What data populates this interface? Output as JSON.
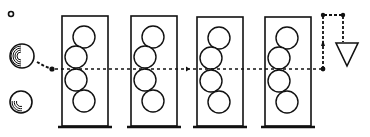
{
  "diagram": {
    "colors": {
      "ink": "#111111",
      "background": "#ffffff"
    },
    "source_items": [
      {
        "id": "small-particle",
        "cx": 11,
        "cy": 14,
        "r": 2.5
      },
      {
        "id": "sphere-top",
        "cx": 22,
        "cy": 56,
        "r": 12,
        "hatch": "left"
      },
      {
        "id": "sphere-bottom",
        "cx": 21,
        "cy": 102,
        "r": 11,
        "hatch": "bottom-left"
      }
    ],
    "columns": [
      {
        "id": "column-1",
        "x": 62,
        "y": 16,
        "w": 46,
        "h": 110
      },
      {
        "id": "column-2",
        "x": 131,
        "y": 16,
        "w": 46,
        "h": 110
      },
      {
        "id": "column-3",
        "x": 197,
        "y": 17,
        "w": 46,
        "h": 109
      },
      {
        "id": "column-4",
        "x": 265,
        "y": 17,
        "w": 46,
        "h": 109
      }
    ],
    "column_spheres": [
      {
        "dx": 22,
        "dy": 21,
        "r": 11
      },
      {
        "dx": 14,
        "dy": 41,
        "r": 11
      },
      {
        "dx": 14,
        "dy": 64,
        "r": 11
      },
      {
        "dx": 22,
        "dy": 85,
        "r": 11
      }
    ],
    "flow_path": {
      "y": 69,
      "start_x": 55,
      "end_x": 323,
      "arrow_markers_x": [
        186
      ],
      "return_path": [
        [
          323,
          69
        ],
        [
          323,
          15
        ],
        [
          343,
          15
        ],
        [
          343,
          42
        ]
      ]
    },
    "outlet": {
      "id": "collector-triangle",
      "points": [
        [
          336,
          43
        ],
        [
          358,
          43
        ],
        [
          347,
          66
        ]
      ]
    }
  }
}
